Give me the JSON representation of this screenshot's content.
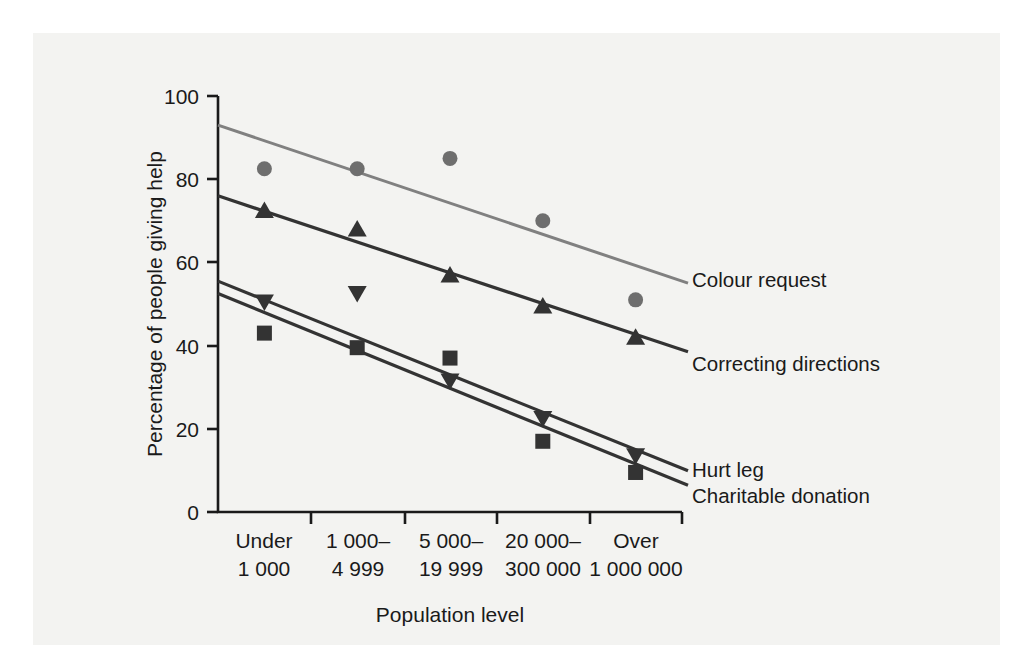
{
  "figure": {
    "background_color": "#ffffff",
    "panel_color": "#f3f3f1"
  },
  "chart_data": {
    "type": "line",
    "title": "",
    "subtitle": "",
    "xlabel": "Population level",
    "ylabel": "Percentage of people giving help",
    "categories": [
      "Under\n1 000",
      "1 000–\n4 999",
      "5 000–\n19 999",
      "20 000–\n300 000",
      "Over\n1 000 000"
    ],
    "category_lines": [
      [
        "Under",
        "1 000"
      ],
      [
        "1 000–",
        "4 999"
      ],
      [
        "5 000–",
        "19 999"
      ],
      [
        "20 000–",
        "300 000"
      ],
      [
        "Over",
        "1 000 000"
      ]
    ],
    "ylim": [
      0,
      100
    ],
    "yticks": [
      0,
      20,
      40,
      60,
      80,
      100
    ],
    "ytick_labels": [
      "0",
      "20",
      "40",
      "60",
      "80",
      "100"
    ],
    "grid": false,
    "legend_position": "right-inline-labels",
    "series": [
      {
        "name": "Colour request",
        "marker": "circle",
        "color": "#6e6e6e",
        "line_color": "#808080",
        "values": [
          82.5,
          82.5,
          85.0,
          70.0,
          51.0
        ],
        "trend_start": 93.0,
        "trend_end": 55.5
      },
      {
        "name": "Correcting directions",
        "marker": "triangle-up",
        "color": "#333333",
        "line_color": "#333333",
        "values": [
          72.5,
          68.0,
          57.0,
          49.5,
          42.0
        ],
        "trend_start": 76.0,
        "trend_end": 39.0
      },
      {
        "name": "Hurt leg",
        "marker": "triangle-down",
        "color": "#333333",
        "line_color": "#333333",
        "values": [
          50.5,
          52.5,
          31.5,
          22.5,
          13.5
        ],
        "trend_start": 55.5,
        "trend_end": 10.5
      },
      {
        "name": "Charitable donation",
        "marker": "square",
        "color": "#333333",
        "line_color": "#333333",
        "values": [
          43.0,
          39.5,
          37.0,
          17.0,
          9.5
        ],
        "trend_start": 52.5,
        "trend_end": 7.0
      }
    ]
  }
}
